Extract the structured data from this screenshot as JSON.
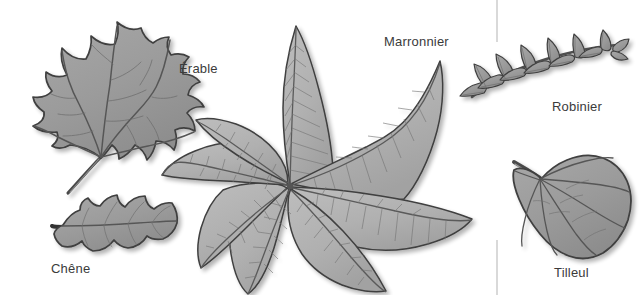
{
  "figure": {
    "kind": "botanical-leaf-plate",
    "background_color": "#ffffff",
    "width": 643,
    "height": 295,
    "label_color": "#3b3b3b",
    "outline_color": "#3f3f3f",
    "leaf_fill": "#9b9b9b",
    "leaf_fill_light": "#b2b2b2",
    "vein_color": "#5a5a5a",
    "divider_color": "#c9c9c9"
  },
  "labels": {
    "erable": "Érable",
    "chene": "Chêne",
    "marronnier": "Marronnier",
    "robinier": "Robinier",
    "tilleul": "Tilleul"
  },
  "specimens": [
    {
      "id": "erable",
      "label": "Érable",
      "leaf_type": "simple-palmately-lobed",
      "lobes": 5,
      "position": "top-left"
    },
    {
      "id": "chene",
      "label": "Chêne",
      "leaf_type": "simple-lobed",
      "lobes": 7,
      "position": "bottom-left"
    },
    {
      "id": "marronnier",
      "label": "Marronnier",
      "leaf_type": "palmately-compound",
      "leaflets": 7,
      "position": "center"
    },
    {
      "id": "robinier",
      "label": "Robinier",
      "leaf_type": "pinnately-compound",
      "leaflets": 11,
      "position": "top-right"
    },
    {
      "id": "tilleul",
      "label": "Tilleul",
      "leaf_type": "simple-cordate",
      "lobes": 1,
      "position": "bottom-right"
    }
  ],
  "divider": {
    "name": "vertical-rule",
    "x": 497,
    "segments": [
      {
        "y1": 0,
        "y2": 42
      },
      {
        "y1": 240,
        "y2": 295
      }
    ]
  }
}
